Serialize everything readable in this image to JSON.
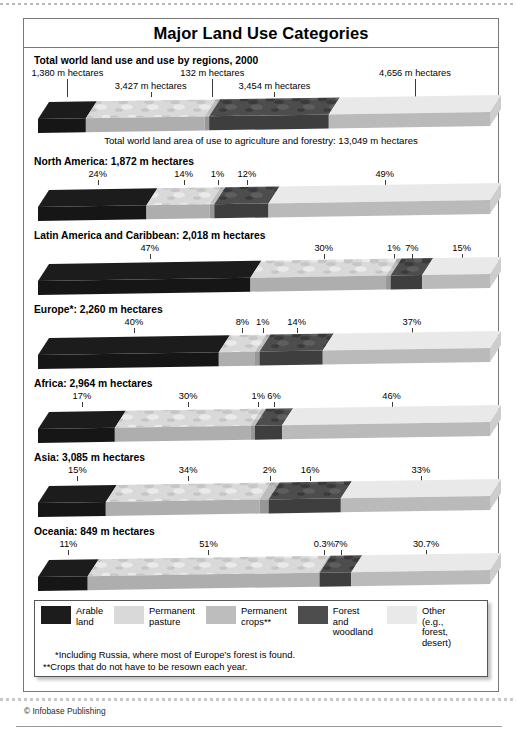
{
  "chart_title": "Major Land Use Categories",
  "section_heading": "Total world land use and use by regions, 2000",
  "world_caption": "Total world land area of use to agriculture and forestry: 13,049 m hectares",
  "credit": "© Infobase Publishing",
  "legend": {
    "items": [
      {
        "label": "Arable\nland",
        "color": "#1c1c1c"
      },
      {
        "label": "Permanent\npasture",
        "color": "#d9d9d9"
      },
      {
        "label": "Permanent\ncrops**",
        "color": "#bdbdbd"
      },
      {
        "label": "Forest and\nwoodland",
        "color": "#4d4d4d"
      },
      {
        "label": "Other\n(e.g., forest,\ndesert)",
        "color": "#e9e9e9"
      }
    ],
    "footnote1": "*Including Russia, where most of Europe’s forest is found.",
    "footnote2": "**Crops that do not have to be resown each year."
  },
  "chart_data": {
    "type": "bar",
    "title": "Major Land Use Categories",
    "subtitle": "Total world land use and use by regions, 2000",
    "orientation": "horizontal-stacked-3d",
    "unit": "million hectares",
    "categories": [
      "Arable land",
      "Permanent pasture",
      "Permanent crops**",
      "Forest and woodland",
      "Other (e.g., forest, desert)"
    ],
    "category_colors": [
      "#1c1c1c",
      "#d9d9d9",
      "#bdbdbd",
      "#4d4d4d",
      "#e9e9e9"
    ],
    "rows": [
      {
        "name": "World",
        "heading": "Total world land use and use by regions, 2000",
        "total_label": "13,049 m hectares",
        "value_type": "absolute",
        "values": [
          1380,
          3427,
          132,
          3454,
          4656
        ],
        "percents": [
          10.6,
          26.3,
          1.0,
          26.5,
          35.7
        ],
        "labels": [
          "1,380 m hectares",
          "3,427 m hectares",
          "132 m hectares",
          "3,454 m hectares",
          "4,656 m hectares"
        ],
        "label_rows": [
          0,
          1,
          0,
          1,
          0
        ],
        "caption": "Total world land area of use to agriculture and forestry: 13,049 m hectares"
      },
      {
        "name": "North America",
        "heading": "North America: 1,872 m hectares",
        "total_label": "1,872 m hectares",
        "value_type": "percent",
        "percents": [
          24,
          14,
          1,
          12,
          49
        ],
        "labels": [
          "24%",
          "14%",
          "1%",
          "12%",
          "49%"
        ],
        "label_rows": [
          0,
          0,
          0,
          0,
          0
        ]
      },
      {
        "name": "Latin America and Caribbean",
        "heading": "Latin America and Caribbean: 2,018 m hectares",
        "total_label": "2,018 m hectares",
        "value_type": "percent",
        "percents": [
          47,
          30,
          1,
          7,
          15
        ],
        "labels": [
          "47%",
          "30%",
          "1%",
          "7%",
          "15%"
        ],
        "label_rows": [
          0,
          0,
          0,
          0,
          0
        ]
      },
      {
        "name": "Europe*",
        "heading": "Europe*: 2,260 m hectares",
        "total_label": "2,260 m hectares",
        "value_type": "percent",
        "percents": [
          40,
          8,
          1,
          14,
          37
        ],
        "labels": [
          "40%",
          "8%",
          "1%",
          "14%",
          "37%"
        ],
        "label_rows": [
          0,
          0,
          0,
          0,
          0
        ]
      },
      {
        "name": "Africa",
        "heading": "Africa: 2,964 m hectares",
        "total_label": "2,964 m hectares",
        "value_type": "percent",
        "percents": [
          17,
          30,
          1,
          6,
          46
        ],
        "labels": [
          "17%",
          "30%",
          "1%",
          "6%",
          "46%"
        ],
        "label_rows": [
          0,
          0,
          0,
          0,
          0
        ]
      },
      {
        "name": "Asia",
        "heading": "Asia: 3,085 m hectares",
        "total_label": "3,085 m hectares",
        "value_type": "percent",
        "percents": [
          15,
          34,
          2,
          16,
          33
        ],
        "labels": [
          "15%",
          "34%",
          "2%",
          "16%",
          "33%"
        ],
        "label_rows": [
          0,
          0,
          0,
          0,
          0
        ]
      },
      {
        "name": "Oceania",
        "heading": "Oceania: 849 m hectares",
        "total_label": "849 m hectares",
        "value_type": "percent",
        "percents": [
          11,
          51,
          0.3,
          7,
          30.7
        ],
        "labels": [
          "11%",
          "51%",
          "0.3%",
          "7%",
          "30.7%"
        ],
        "label_rows": [
          0,
          0,
          0,
          0,
          0
        ]
      }
    ]
  }
}
